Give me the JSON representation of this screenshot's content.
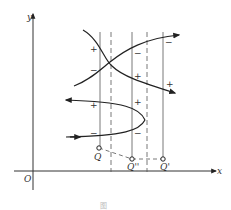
{
  "diagram": {
    "axes": {
      "x_label": "x",
      "y_label": "y",
      "origin_label": "O"
    },
    "points": [
      {
        "label": "Q",
        "x": 99,
        "y": 148
      },
      {
        "label": "Q''",
        "x": 132,
        "y": 159
      },
      {
        "label": "Q'",
        "x": 163,
        "y": 159
      }
    ],
    "solid_verticals_x": [
      100,
      132,
      163
    ],
    "dashed_verticals_x": [
      111,
      147
    ],
    "signs": {
      "s1": "+",
      "s2": "−",
      "s3": "−",
      "s4": "+",
      "s5": "−",
      "s6": "+",
      "s7": "+",
      "s8": "+",
      "s9": "−",
      "s10": "−"
    },
    "caption": "图 "
  }
}
